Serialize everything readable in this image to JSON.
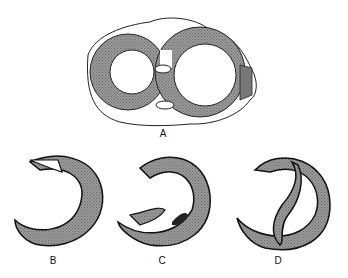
{
  "figure": {
    "panels": [
      {
        "id": "A",
        "label": "A",
        "description": "Cross-section of both ventricles"
      },
      {
        "id": "B",
        "label": "B",
        "description": "Ventricle ring with tear at top"
      },
      {
        "id": "C",
        "label": "C",
        "description": "Ventricle ring with flap at bottom"
      },
      {
        "id": "D",
        "label": "D",
        "description": "Ventricle ring with inner septal band"
      }
    ],
    "colors": {
      "wall": "#8a8a8a",
      "outline": "#111111",
      "background": "#ffffff"
    }
  }
}
